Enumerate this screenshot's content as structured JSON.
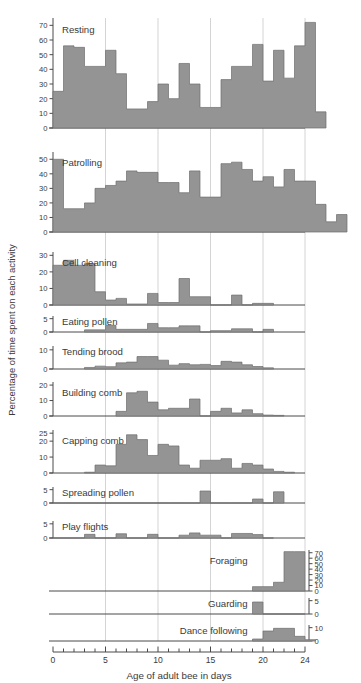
{
  "chart_data": {
    "type": "bar",
    "title": "",
    "xlabel": "Age of adult bee in days",
    "ylabel": "Percentage of time spent on each activity",
    "xlim": [
      0,
      24
    ],
    "x_major_ticks": [
      0,
      5,
      10,
      15,
      20,
      24
    ],
    "x_minor_ticks": [
      1,
      2,
      3,
      4,
      6,
      7,
      8,
      9,
      11,
      12,
      13,
      14,
      16,
      17,
      18,
      19,
      21,
      22,
      23
    ],
    "x_gridlines": [
      5,
      10,
      15,
      20,
      24
    ],
    "grid": true,
    "legend": "none",
    "bin_width_days": 1,
    "note": "Eleven stacked sub-panels, one per activity; each bar covers one day of adult bee age.",
    "panels": [
      {
        "name": "Resting",
        "label": "Resting",
        "label_align": "left",
        "axis_side": "left",
        "ylim": [
          0,
          75
        ],
        "yticks": [
          0,
          10,
          20,
          30,
          40,
          50,
          60,
          70
        ],
        "x_start": 0,
        "values": [
          25,
          56,
          55,
          42,
          42,
          53,
          37,
          13,
          13,
          18,
          30,
          20,
          44,
          30,
          14,
          14,
          33,
          42,
          42,
          57,
          32,
          53,
          34,
          56,
          72,
          11
        ]
      },
      {
        "name": "Patrolling",
        "label": "Patrolling",
        "label_align": "left",
        "axis_side": "left",
        "ylim": [
          0,
          55
        ],
        "yticks": [
          0,
          10,
          20,
          30,
          40,
          50
        ],
        "x_start": 0,
        "values": [
          50,
          16,
          16,
          20,
          30,
          32,
          35,
          42,
          41,
          41,
          34,
          34,
          27,
          42,
          24,
          24,
          47,
          48,
          43,
          35,
          38,
          31,
          43,
          35,
          35,
          19,
          7,
          12
        ]
      },
      {
        "name": "Cell cleaning",
        "label": "Cell cleaning",
        "label_align": "left",
        "axis_side": "left",
        "ylim": [
          0,
          32
        ],
        "yticks": [
          0,
          10,
          20,
          30
        ],
        "x_start": 0,
        "values": [
          24,
          27,
          24,
          25,
          8,
          3,
          4,
          0.6,
          0.6,
          7,
          1.5,
          1.5,
          16,
          5,
          5,
          0,
          0,
          6,
          0,
          1,
          1
        ]
      },
      {
        "name": "Eating pollen",
        "label": "Eating pollen",
        "label_align": "left",
        "axis_side": "left",
        "ylim": [
          0,
          6
        ],
        "yticks": [
          0,
          5
        ],
        "x_start": 3,
        "values": [
          0.8,
          0.8,
          2.5,
          1.0,
          1.0,
          1.0,
          3.2,
          1.6,
          1.6,
          2.3,
          2.3,
          0,
          0.5,
          0.5,
          1.2,
          1.2,
          0,
          1.0
        ]
      },
      {
        "name": "Tending brood",
        "label": "Tending brood",
        "label_align": "left",
        "axis_side": "left",
        "ylim": [
          0,
          12
        ],
        "yticks": [
          0,
          10
        ],
        "x_start": 3,
        "values": [
          0.8,
          1.5,
          1.2,
          3.2,
          3.6,
          6.5,
          6.5,
          4.6,
          2.0,
          2.8,
          2.2,
          2.4,
          1.8,
          4.0,
          3.6,
          2.2,
          1.3,
          0.6
        ]
      },
      {
        "name": "Building comb",
        "label": "Building comb",
        "label_align": "left",
        "axis_side": "left",
        "ylim": [
          0,
          22
        ],
        "yticks": [
          0,
          10,
          20
        ],
        "x_start": 6,
        "values": [
          3,
          15,
          16,
          9,
          4,
          5,
          5,
          11,
          0,
          3,
          5,
          2,
          4,
          1.5,
          0.6,
          0.4
        ]
      },
      {
        "name": "Capping comb",
        "label": "Capping comb",
        "label_align": "left",
        "axis_side": "left",
        "ylim": [
          0,
          27
        ],
        "yticks": [
          0,
          10,
          20,
          25
        ],
        "x_start": 3,
        "values": [
          0.5,
          5,
          4.5,
          18,
          24,
          21,
          11,
          18,
          17,
          5,
          3,
          8,
          8,
          9,
          3,
          6,
          5,
          2.5,
          1,
          0.5
        ]
      },
      {
        "name": "Spreading pollen",
        "label": "Spreading pollen",
        "label_align": "left",
        "axis_side": "left",
        "ylim": [
          0,
          6
        ],
        "yticks": [
          0,
          5
        ],
        "x_start": 0,
        "values": [
          0,
          0,
          0,
          0,
          0,
          0,
          0,
          0,
          0,
          0,
          0,
          0,
          0,
          0,
          4.5,
          0,
          0,
          0,
          0,
          1.5,
          0,
          4.2
        ]
      },
      {
        "name": "Play flights",
        "label": "Play flights",
        "label_align": "left",
        "axis_side": "left",
        "ylim": [
          0,
          6
        ],
        "yticks": [
          0,
          5
        ],
        "x_start": 0,
        "values": [
          0,
          0,
          0,
          1.3,
          0,
          0,
          1.5,
          0,
          0,
          1.3,
          0,
          0,
          1.0,
          1.8,
          1.0,
          1.0,
          0,
          1.6,
          1.6,
          1.2,
          0
        ]
      },
      {
        "name": "Foraging",
        "label": "Foraging",
        "label_align": "right",
        "axis_side": "right",
        "ylim": [
          0,
          75
        ],
        "yticks": [
          0,
          10,
          20,
          30,
          40,
          50,
          60,
          70
        ],
        "x_start": 19,
        "values": [
          8,
          8,
          16,
          72,
          72
        ]
      },
      {
        "name": "Guarding",
        "label": "Guarding",
        "label_align": "right",
        "axis_side": "right",
        "ylim": [
          0,
          6
        ],
        "yticks": [
          0,
          5
        ],
        "x_start": 19,
        "values": [
          4.5,
          0,
          0,
          0,
          0
        ]
      },
      {
        "name": "Dance following",
        "label": "Dance following",
        "label_align": "right",
        "axis_side": "right",
        "ylim": [
          0,
          12
        ],
        "yticks": [
          0,
          10
        ],
        "x_start": 19,
        "values": [
          1.5,
          7.5,
          9.5,
          9.5,
          3.5,
          1.0
        ]
      }
    ]
  }
}
